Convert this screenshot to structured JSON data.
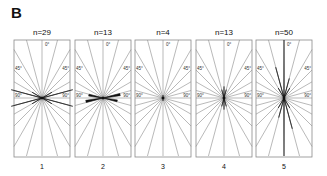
{
  "figure": {
    "panel_letter": "B"
  },
  "chart_data": {
    "type": "rose",
    "title": "",
    "panel_letter": "B",
    "angle_labels": [
      "0°",
      "45°",
      "45°",
      "90°",
      "90°"
    ],
    "angle_range_deg": [
      -90,
      90
    ],
    "sector_step_deg": 15,
    "panels": [
      {
        "id": "1",
        "n_label": "n=29",
        "n": 29,
        "dominant_orientation": "~±70–80° (near horizontal)",
        "petals": [
          {
            "angle": -75,
            "length": 0.55
          },
          {
            "angle": 75,
            "length": 0.55
          },
          {
            "angle": -60,
            "length": 0.2
          },
          {
            "angle": 60,
            "length": 0.2
          }
        ]
      },
      {
        "id": "2",
        "n_label": "n=13",
        "n": 13,
        "dominant_orientation": "~±80° (near horizontal, small)",
        "petals": [
          {
            "angle": -80,
            "length": 0.25
          },
          {
            "angle": 80,
            "length": 0.3
          }
        ]
      },
      {
        "id": "3",
        "n_label": "n=4",
        "n": 4,
        "dominant_orientation": "isotropic, very small",
        "petals": [
          {
            "angle": 0,
            "length": 0.05
          }
        ]
      },
      {
        "id": "4",
        "n_label": "n=13",
        "n": 13,
        "dominant_orientation": "~0° (near vertical, small)",
        "petals": [
          {
            "angle": 0,
            "length": 0.2
          },
          {
            "angle": 15,
            "length": 0.15
          },
          {
            "angle": -15,
            "length": 0.15
          }
        ]
      },
      {
        "id": "5",
        "n_label": "n=50",
        "n": 50,
        "dominant_orientation": "~0° (vertical)",
        "petals": [
          {
            "angle": 0,
            "length": 1.0
          },
          {
            "angle": -15,
            "length": 0.55
          },
          {
            "angle": 15,
            "length": 0.35
          },
          {
            "angle": -30,
            "length": 0.2
          },
          {
            "angle": 30,
            "length": 0.2
          }
        ]
      }
    ],
    "xlabel": "",
    "ylabel": "",
    "grid": true,
    "legend": null
  },
  "panels": [
    {
      "n_label": "n=29",
      "index_label": "1"
    },
    {
      "n_label": "n=13",
      "index_label": "2"
    },
    {
      "n_label": "n=4",
      "index_label": "3"
    },
    {
      "n_label": "n=13",
      "index_label": "4"
    },
    {
      "n_label": "n=50",
      "index_label": "5"
    }
  ],
  "axis_labels": {
    "zero": "0°",
    "left45": "45°",
    "right45": "45°",
    "left90": "90°",
    "right90": "90°"
  }
}
